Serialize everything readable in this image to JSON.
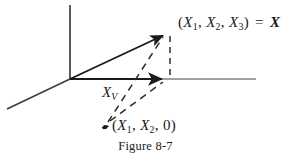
{
  "figure": {
    "caption": "Figure 8-7",
    "colors": {
      "ink": "#1a1a1a",
      "axis": "#3a3a3a",
      "axis_light": "#8a8a8a",
      "dash": "#2b2b2b",
      "background": "#ffffff"
    },
    "labels": {
      "vector_tip": {
        "open_paren": "(",
        "var1": "X",
        "sub1": "1",
        "comma1": ",",
        "var2": "X",
        "sub2": "2",
        "comma2": ",",
        "var3": "X",
        "sub3": "3",
        "close_paren": ")",
        "equals": "=",
        "vector_name": "X",
        "full_text": "(X1, X2, X3) = X"
      },
      "projection": {
        "var": "X",
        "sub": "V",
        "full_text": "XV"
      },
      "foot_point": {
        "open_paren": "(",
        "var1": "X",
        "sub1": "1",
        "comma1": ",",
        "var2": "X",
        "sub2": "2",
        "comma2": ",",
        "zero": "0",
        "close_paren": ")",
        "full_text": "(X1, X2, 0)"
      }
    },
    "geometry": {
      "origin": {
        "x": 70,
        "y": 79
      },
      "axis_vertical_top": {
        "x": 70,
        "y": 5
      },
      "axis_horizontal_end": {
        "x": 256,
        "y": 79
      },
      "axis_depth_end": {
        "x": 7,
        "y": 109
      },
      "vector_tip": {
        "x": 167,
        "y": 33
      },
      "horizontal_arrow_tip": {
        "x": 167,
        "y": 79
      },
      "foot_point_marker": {
        "x": 105,
        "y": 127
      }
    },
    "elements": {
      "vertical_axis_name": "vertical-axis",
      "horizontal_axis_name": "horizontal-axis",
      "depth_axis_name": "depth-axis",
      "main_vector_name": "main-vector-arrow",
      "projection_vector_name": "projection-vector-arrow",
      "drop_line_name": "vertical-drop-dashed-line",
      "dash_to_tip_name": "dashed-line-to-vector-tip",
      "dash_to_foot_name": "dashed-line-to-projection-tip",
      "point_marker_name": "point-marker-dot"
    }
  }
}
